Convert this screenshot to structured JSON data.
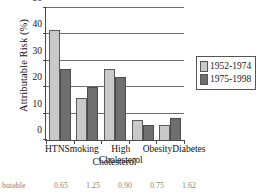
{
  "chart_data": {
    "type": "bar",
    "title": "",
    "xlabel": "Cholesterol",
    "ylabel": "Attributable Risk (%)",
    "categories": [
      "HTN",
      "Smoking",
      "High",
      "Obesity",
      "Diabetes"
    ],
    "category_sublabels": [
      "",
      "",
      "Cholesterol",
      "",
      ""
    ],
    "series": [
      {
        "name": "1952-1974",
        "color": "#c9c9c9",
        "values": [
          41.5,
          16.0,
          27.0,
          7.5,
          5.5
        ]
      },
      {
        "name": "1975-1998",
        "color": "#6f6f6f",
        "values": [
          27.0,
          20.0,
          24.0,
          5.5,
          8.5
        ]
      }
    ],
    "ylim": [
      0,
      50
    ],
    "yticks": [
      0,
      10,
      20,
      30,
      40,
      50
    ],
    "ytick_labels": [
      "0",
      "10",
      "20",
      "30",
      "40",
      "50"
    ],
    "grid": true,
    "legend_position": "right"
  },
  "legend": {
    "items": [
      {
        "label": "1952-1974"
      },
      {
        "label": "1975-1998"
      }
    ]
  },
  "footer_row": {
    "row_label": "butable",
    "values": [
      "0.65",
      "1.25",
      "0.90",
      "0.75",
      "1.62"
    ]
  }
}
